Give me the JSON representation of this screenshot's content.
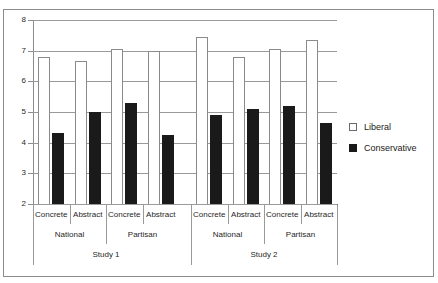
{
  "chart_data": {
    "type": "bar",
    "title": "",
    "subtitle": "",
    "xlabel": "",
    "ylabel": "",
    "ylim": [
      2,
      8
    ],
    "yticks": [
      2,
      3,
      4,
      5,
      6,
      7,
      8
    ],
    "ytick_labels": [
      "2",
      "3",
      "4",
      "5",
      "6",
      "7",
      "8"
    ],
    "grid": true,
    "legend_position": "right",
    "categories": [
      "Study 1 / National / Concrete",
      "Study 1 / National / Abstract",
      "Study 1 / Partisan / Concrete",
      "Study 1 / Partisan / Abstract",
      "Study 2 / National / Concrete",
      "Study 2 / National / Abstract",
      "Study 2 / Partisan / Concrete",
      "Study 2 / Partisan / Abstract"
    ],
    "series": [
      {
        "name": "Liberal",
        "color": "#ffffff",
        "values": [
          6.8,
          6.65,
          7.05,
          7.0,
          7.45,
          6.8,
          7.05,
          7.35
        ]
      },
      {
        "name": "Conservative",
        "color": "#1a1a1a",
        "values": [
          4.3,
          5.0,
          5.3,
          4.25,
          4.9,
          5.1,
          5.2,
          4.65
        ]
      }
    ],
    "group_levels": {
      "level1_labels": [
        "Concrete",
        "Abstract",
        "Concrete",
        "Abstract",
        "Concrete",
        "Abstract",
        "Concrete",
        "Abstract"
      ],
      "level2_labels": [
        "National",
        "Partisan",
        "National",
        "Partisan"
      ],
      "level3_labels": [
        "Study 1",
        "Study 2"
      ]
    }
  },
  "legend": {
    "items": [
      {
        "label": "Liberal",
        "swatch": "open-square"
      },
      {
        "label": "Conservative",
        "swatch": "filled-square"
      }
    ]
  },
  "axis": {
    "y_labels": [
      "8",
      "7",
      "6",
      "5",
      "4",
      "3",
      "2"
    ]
  },
  "category_axis": {
    "level1": [
      "Concrete",
      "Abstract",
      "Concrete",
      "Abstract",
      "Concrete",
      "Abstract",
      "Concrete",
      "Abstract"
    ],
    "level2": [
      "National",
      "Partisan",
      "National",
      "Partisan"
    ],
    "level3": [
      "Study 1",
      "Study 2"
    ]
  }
}
